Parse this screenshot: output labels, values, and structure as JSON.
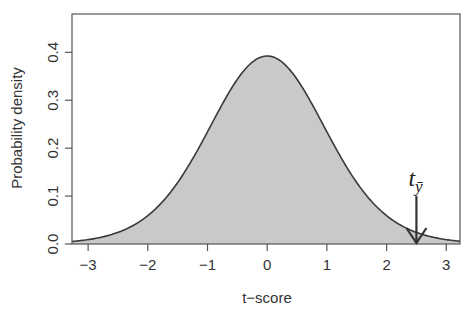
{
  "chart_data": {
    "type": "area",
    "title": "",
    "xlabel": "t−score",
    "ylabel": "Probability density",
    "xlim": [
      -3.27,
      3.23
    ],
    "ylim": [
      0,
      0.48
    ],
    "xticks": [
      -3,
      -2,
      -1,
      0,
      1,
      2,
      3
    ],
    "xtick_labels": [
      "−3",
      "−2",
      "−1",
      "0",
      "1",
      "2",
      "3"
    ],
    "yticks": [
      0.0,
      0.1,
      0.2,
      0.3,
      0.4
    ],
    "ytick_labels": [
      "0.0",
      "0.1",
      "0.2",
      "0.3",
      "0.4"
    ],
    "grid": false,
    "legend": null,
    "distribution": "Student t",
    "df": 15,
    "series": [
      {
        "name": "t density",
        "x": [
          -3.0,
          -2.5,
          -2.0,
          -1.5,
          -1.0,
          -0.5,
          0.0,
          0.5,
          1.0,
          1.5,
          2.0,
          2.5,
          3.0
        ],
        "values": [
          0.009,
          0.023,
          0.059,
          0.126,
          0.232,
          0.345,
          0.392,
          0.345,
          0.232,
          0.126,
          0.059,
          0.023,
          0.009
        ],
        "fill_color": "#c9c9c9",
        "line_color": "#3a3a3a"
      }
    ],
    "annotations": [
      {
        "type": "arrow",
        "label": "t",
        "label_subscript": "ȳ",
        "x": 2.5,
        "y_from": 0.1,
        "y_to": 0.0,
        "description": "downward arrow marking observed t-score"
      }
    ]
  }
}
